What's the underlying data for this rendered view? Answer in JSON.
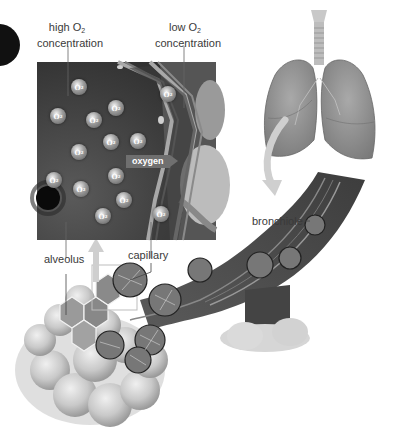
{
  "figure": {
    "type": "anatomical-illustration",
    "color_mode": "grayscale"
  },
  "labels": {
    "high_o2": {
      "line1": "high O",
      "sub": "2",
      "line2": "concentration"
    },
    "low_o2": {
      "line1": "low O",
      "sub": "2",
      "line2": "concentration"
    },
    "oxygen_arrow": "oxygen",
    "alveolus": "alveolus",
    "capillary": "capillary",
    "bronchiole": "bronchiole"
  },
  "o2_molecule": {
    "symbol": "O",
    "sub": "2"
  },
  "o2_positions": [
    [
      79,
      87
    ],
    [
      168,
      94
    ],
    [
      116,
      108
    ],
    [
      58,
      116
    ],
    [
      94,
      120
    ],
    [
      111,
      142
    ],
    [
      138,
      141
    ],
    [
      79,
      152
    ],
    [
      116,
      176
    ],
    [
      54,
      180
    ],
    [
      81,
      189
    ],
    [
      124,
      200
    ],
    [
      103,
      216
    ],
    [
      161,
      214
    ]
  ],
  "colors": {
    "inset_dark": "#3a3a3a",
    "inset_mid": "#6a6a6a",
    "capillary_wall": "#9c9c9c",
    "lung_fill": "#8e8e8e",
    "arrow_fill": "#cfcfcf",
    "label_text": "#3a3a3a"
  }
}
